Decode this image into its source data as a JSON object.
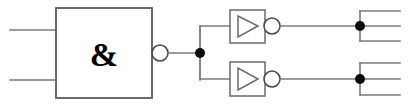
{
  "diagram": {
    "background_color": "#ffffff",
    "wire_color": "#7a7a7a",
    "outline_color": "#5a5a5a",
    "junction_color": "#0b0b0b",
    "width": 408,
    "height": 106
  },
  "and_gate": {
    "symbol": "&",
    "type": "and-gate-iec",
    "inverted_output": true,
    "box": {
      "x": 56,
      "y": 8,
      "width": 96,
      "height": 90
    },
    "bubble": {
      "cx": 160,
      "cy": 53,
      "r": 8
    },
    "inputs": [
      {
        "name": "input-1",
        "x1": 10,
        "y": 30,
        "x2": 56
      },
      {
        "name": "input-2",
        "x1": 10,
        "y": 80,
        "x2": 56
      }
    ]
  },
  "fanout_node": {
    "name": "output-junction",
    "cx": 200,
    "cy": 53,
    "r": 5,
    "branch_top_y": 26,
    "branch_bottom_y": 80
  },
  "inverters": [
    {
      "name": "inverter-top",
      "symbol": "buffer-triangle",
      "inverted_output": true,
      "box": {
        "x": 230,
        "y": 10,
        "width": 35,
        "height": 33
      },
      "triangle": {
        "x1": 238,
        "y1": 16,
        "x2": 238,
        "y2": 37,
        "x3": 258,
        "y3": 26
      },
      "bubble": {
        "cx": 272,
        "cy": 26,
        "r": 8
      },
      "input_wire": {
        "x1": 200,
        "y": 26,
        "x2": 230
      },
      "output_wire": {
        "x1": 280,
        "y": 26,
        "x2": 360
      }
    },
    {
      "name": "inverter-bottom",
      "symbol": "buffer-triangle",
      "inverted_output": true,
      "box": {
        "x": 230,
        "y": 62,
        "width": 35,
        "height": 34
      },
      "triangle": {
        "x1": 238,
        "y1": 68,
        "x2": 238,
        "y2": 90,
        "x3": 258,
        "y3": 79
      },
      "bubble": {
        "cx": 272,
        "cy": 79,
        "r": 8
      },
      "input_wire": {
        "x1": 200,
        "y": 79,
        "x2": 230
      },
      "output_wire": {
        "x1": 280,
        "y": 79,
        "x2": 360
      }
    }
  ],
  "output_nodes": [
    {
      "name": "output-junction-top",
      "cx": 360,
      "cy": 26,
      "r": 5,
      "branch_up_y": 11,
      "branch_down_y": 41,
      "branch_right_x": 400,
      "stub_right_x": 400
    },
    {
      "name": "output-junction-bottom",
      "cx": 360,
      "cy": 79,
      "r": 5,
      "branch_up_y": 63,
      "branch_down_y": 95,
      "branch_right_x": 400,
      "stub_right_x": 400
    }
  ]
}
